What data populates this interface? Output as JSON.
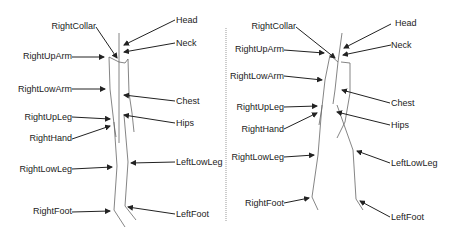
{
  "figures": [
    {
      "id": "left",
      "labels": {
        "head": "Head",
        "neck": "Neck",
        "chest": "Chest",
        "hips": "Hips",
        "left_low_leg": "LeftLowLeg",
        "left_foot": "LeftFoot",
        "right_collar": "RightCollar",
        "right_up_arm": "RightUpArm",
        "right_low_arm": "RightLowArm",
        "right_up_leg": "RightUpLeg",
        "right_hand": "RightHand",
        "right_low_leg": "RightLowLeg",
        "right_foot": "RightFoot"
      }
    },
    {
      "id": "right",
      "labels": {
        "head": "Head",
        "neck": "Neck",
        "chest": "Chest",
        "hips": "Hips",
        "left_low_leg": "LeftLowLeg",
        "left_foot": "LeftFoot",
        "right_collar": "RightCollar",
        "right_up_arm": "RightUpArm",
        "right_low_arm": "RightLowArm",
        "right_up_leg": "RightUpLeg",
        "right_hand": "RightHand",
        "right_low_leg": "RightLowLeg",
        "right_foot": "RightFoot"
      }
    }
  ],
  "colors": {
    "line": "#555555",
    "arrow": "#222222",
    "divider": "#999999"
  }
}
